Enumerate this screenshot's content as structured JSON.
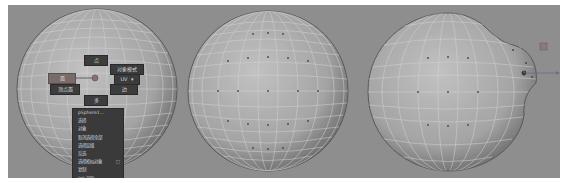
{
  "viewports": [
    {
      "name": "sphere-with-marking-menu",
      "state": "object selected, right-click marking menu open"
    },
    {
      "name": "sphere-vertex-mode",
      "state": "vertex component mode"
    },
    {
      "name": "sphere-deformed",
      "state": "vertices moved with manipulator"
    }
  ],
  "marking_menu": {
    "north": "点",
    "northeast": "对象模式",
    "west": "面",
    "east": "UV",
    "east_suffix": "▾",
    "southwest": "顶点面",
    "southeast": "边",
    "south": "多"
  },
  "context_menu": {
    "title": "pSphere1...",
    "items": [
      {
        "label": "选择"
      },
      {
        "label": "对象"
      },
      {
        "label": "取消选择全部"
      },
      {
        "label": "选择层级"
      },
      {
        "label": "反选"
      },
      {
        "label": "选择相似对象",
        "suffix": "□"
      },
      {
        "label": "复制"
      },
      {
        "label": "DG 遍历",
        "suffix": "▸"
      }
    ]
  },
  "colors": {
    "viewport_bg": "#8e8e8e",
    "sphere_light": "#b9b9b9",
    "sphere_dark": "#6e6e6e",
    "wire": "#d2d2d2",
    "menu_bg": "#3a3a3a",
    "menu_highlight": "#7a6a6a"
  }
}
